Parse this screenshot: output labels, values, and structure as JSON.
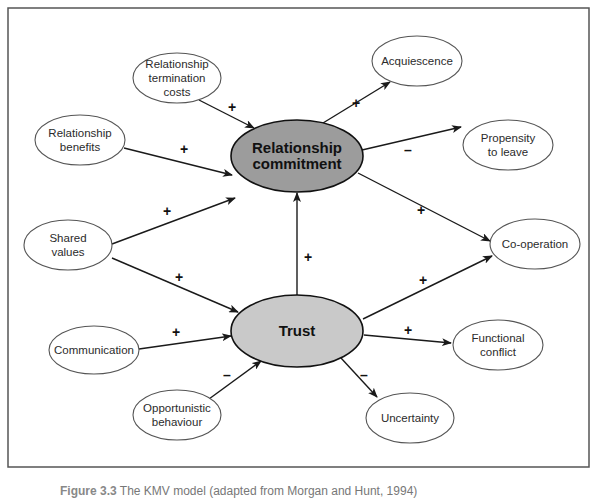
{
  "diagram": {
    "type": "causal-model",
    "core_nodes": [
      {
        "id": "commitment",
        "lines": [
          "Relationship",
          "commitment"
        ],
        "cx": 297,
        "cy": 156,
        "rx": 66,
        "ry": 36,
        "fill": "#9c9c9c"
      },
      {
        "id": "trust",
        "lines": [
          "Trust"
        ],
        "cx": 297,
        "cy": 331,
        "rx": 66,
        "ry": 36,
        "fill": "#c9c9c9"
      }
    ],
    "nodes": [
      {
        "id": "termination",
        "lines": [
          "Relationship",
          "termination",
          "costs"
        ],
        "cx": 177,
        "cy": 78,
        "rx": 44,
        "ry": 25
      },
      {
        "id": "benefits",
        "lines": [
          "Relationship",
          "benefits"
        ],
        "cx": 80,
        "cy": 140,
        "rx": 45,
        "ry": 25
      },
      {
        "id": "shared",
        "lines": [
          "Shared",
          "values"
        ],
        "cx": 68,
        "cy": 245,
        "rx": 44,
        "ry": 25
      },
      {
        "id": "communication",
        "lines": [
          "Communication"
        ],
        "cx": 94,
        "cy": 350,
        "rx": 45,
        "ry": 24
      },
      {
        "id": "opportunistic",
        "lines": [
          "Opportunistic",
          "behaviour"
        ],
        "cx": 177,
        "cy": 415,
        "rx": 44,
        "ry": 25
      },
      {
        "id": "acquiescence",
        "lines": [
          "Acquiescence"
        ],
        "cx": 417,
        "cy": 61,
        "rx": 45,
        "ry": 25
      },
      {
        "id": "propensity",
        "lines": [
          "Propensity",
          "to leave"
        ],
        "cx": 508,
        "cy": 145,
        "rx": 45,
        "ry": 25
      },
      {
        "id": "cooperation",
        "lines": [
          "Co-operation"
        ],
        "cx": 535,
        "cy": 244,
        "rx": 45,
        "ry": 25
      },
      {
        "id": "functional",
        "lines": [
          "Functional",
          "conflict"
        ],
        "cx": 498,
        "cy": 345,
        "rx": 45,
        "ry": 25
      },
      {
        "id": "uncertainty",
        "lines": [
          "Uncertainty"
        ],
        "cx": 410,
        "cy": 418,
        "rx": 44,
        "ry": 25
      }
    ],
    "edges": [
      {
        "from": "termination",
        "to": "commitment",
        "sign": "+",
        "x1": 199,
        "y1": 100,
        "x2": 254,
        "y2": 128,
        "lx": 232,
        "ly": 112
      },
      {
        "from": "benefits",
        "to": "commitment",
        "sign": "+",
        "x1": 124,
        "y1": 148,
        "x2": 232,
        "y2": 175,
        "lx": 184,
        "ly": 154
      },
      {
        "from": "shared",
        "to": "commitment",
        "sign": "+",
        "x1": 112,
        "y1": 244,
        "x2": 235,
        "y2": 198,
        "lx": 167,
        "ly": 216
      },
      {
        "from": "shared",
        "to": "trust",
        "sign": "+",
        "x1": 112,
        "y1": 258,
        "x2": 238,
        "y2": 312,
        "lx": 179,
        "ly": 282
      },
      {
        "from": "communication",
        "to": "trust",
        "sign": "+",
        "x1": 139,
        "y1": 349,
        "x2": 231,
        "y2": 336,
        "lx": 176,
        "ly": 337
      },
      {
        "from": "opportunistic",
        "to": "trust",
        "sign": "–",
        "x1": 209,
        "y1": 399,
        "x2": 261,
        "y2": 361,
        "lx": 227,
        "ly": 380
      },
      {
        "from": "trust",
        "to": "commitment",
        "sign": "+",
        "x1": 297,
        "y1": 295,
        "x2": 297,
        "y2": 193,
        "lx": 308,
        "ly": 262
      },
      {
        "from": "commitment",
        "to": "acquiescence",
        "sign": "+",
        "x1": 323,
        "y1": 123,
        "x2": 390,
        "y2": 82,
        "lx": 356,
        "ly": 108
      },
      {
        "from": "commitment",
        "to": "propensity",
        "sign": "–",
        "x1": 362,
        "y1": 150,
        "x2": 461,
        "y2": 127,
        "lx": 408,
        "ly": 155
      },
      {
        "from": "commitment",
        "to": "cooperation",
        "sign": "+",
        "x1": 358,
        "y1": 173,
        "x2": 490,
        "y2": 241,
        "lx": 421,
        "ly": 215
      },
      {
        "from": "trust",
        "to": "cooperation",
        "sign": "+",
        "x1": 363,
        "y1": 319,
        "x2": 492,
        "y2": 256,
        "lx": 423,
        "ly": 285
      },
      {
        "from": "trust",
        "to": "functional",
        "sign": "+",
        "x1": 364,
        "y1": 335,
        "x2": 451,
        "y2": 343,
        "lx": 408,
        "ly": 335
      },
      {
        "from": "trust",
        "to": "uncertainty",
        "sign": "–",
        "x1": 341,
        "y1": 358,
        "x2": 377,
        "y2": 397,
        "lx": 364,
        "ly": 380
      }
    ]
  },
  "frame": {
    "x": 8,
    "y": 8,
    "width": 581,
    "height": 459
  },
  "caption": {
    "figure_label": "Figure 3.3",
    "text": "The KMV model (adapted from Morgan and Hunt, 1994)"
  }
}
